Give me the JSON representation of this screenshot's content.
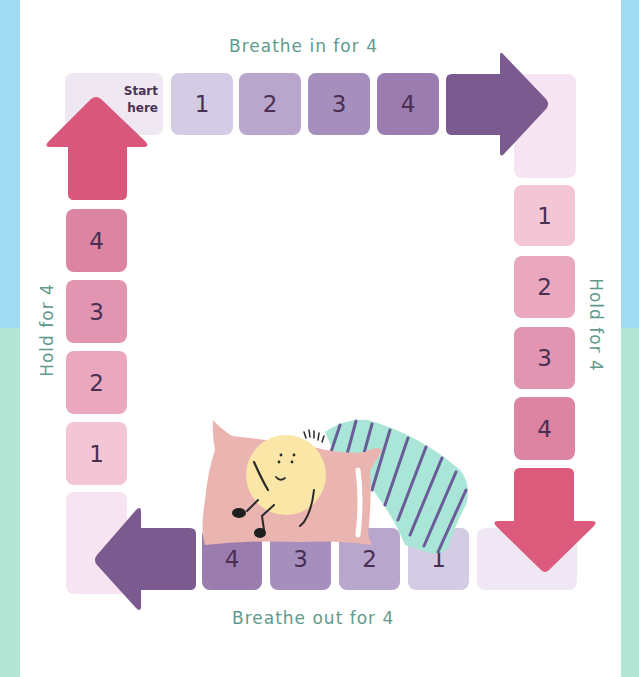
{
  "background": {
    "top_color": "#9fdcf3",
    "bottom_color": "#b4e6d6",
    "panel_color": "#ffffff"
  },
  "labels": {
    "top": "Breathe in for 4",
    "right": "Hold for 4",
    "bottom": "Breathe out for 4",
    "left": "Hold for 4",
    "color": "#5f9a8c"
  },
  "start_tile": {
    "line1": "Start",
    "line2": "here",
    "color": "#efe7f1"
  },
  "top_row": {
    "tiles": [
      {
        "label": "1",
        "color": "#d3cce4"
      },
      {
        "label": "2",
        "color": "#b8a6cc"
      },
      {
        "label": "3",
        "color": "#a68ebd"
      },
      {
        "label": "4",
        "color": "#9a7cae"
      }
    ],
    "arrow": {
      "direction": "right",
      "icon": "arrow-right-icon",
      "color": "#7b5a8f"
    }
  },
  "right_column": {
    "corner_color": "#f6e4f2",
    "tiles": [
      {
        "label": "1",
        "color": "#f2c6d4"
      },
      {
        "label": "2",
        "color": "#eaa8bf"
      },
      {
        "label": "3",
        "color": "#e295b0"
      },
      {
        "label": "4",
        "color": "#dd84a2"
      }
    ],
    "arrow": {
      "direction": "down",
      "icon": "arrow-down-icon",
      "color": "#dc5a7c"
    }
  },
  "bottom_row": {
    "corner_color": "#efe8f4",
    "tiles": [
      {
        "label": "4",
        "color": "#9a7cae"
      },
      {
        "label": "3",
        "color": "#a68ebd"
      },
      {
        "label": "2",
        "color": "#b8a6cc"
      },
      {
        "label": "1",
        "color": "#d3cce4"
      }
    ],
    "arrow": {
      "direction": "left",
      "icon": "arrow-left-icon",
      "color": "#7b5a8f"
    }
  },
  "left_column": {
    "corner_color": "#f6e4f2",
    "tiles": [
      {
        "label": "4",
        "color": "#dd84a2"
      },
      {
        "label": "3",
        "color": "#e295b0"
      },
      {
        "label": "2",
        "color": "#eaa8bf"
      },
      {
        "label": "1",
        "color": "#f2c6d4"
      }
    ],
    "arrow": {
      "direction": "up",
      "icon": "arrow-up-icon",
      "color": "#d9577a"
    }
  },
  "illustration": {
    "name": "sleeping-character-on-pillow"
  }
}
